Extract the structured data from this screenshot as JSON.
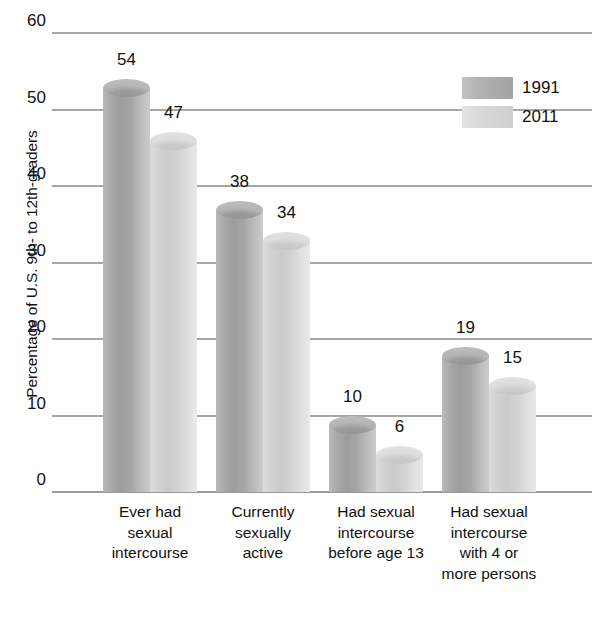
{
  "chart_data": {
    "type": "bar",
    "title": "",
    "xlabel": "",
    "ylabel": "Percentage of U.S. 9th- to 12th-graders",
    "ylim": [
      0,
      60
    ],
    "yticks": [
      0,
      10,
      20,
      30,
      40,
      50,
      60
    ],
    "grid": true,
    "legend_position": "top-right",
    "categories": [
      "Ever had sexual intercourse",
      "Currently sexually active",
      "Had sexual intercourse before age 13",
      "Had sexual intercourse with 4 or more persons"
    ],
    "category_lines": [
      [
        "Ever had",
        "sexual",
        "intercourse"
      ],
      [
        "Currently",
        "sexually",
        "active"
      ],
      [
        "Had sexual",
        "intercourse",
        "before age 13"
      ],
      [
        "Had sexual",
        "intercourse",
        "with 4 or",
        "more persons"
      ]
    ],
    "series": [
      {
        "name": "1991",
        "color": "#a8a8a8",
        "values": [
          54,
          38,
          10,
          19
        ]
      },
      {
        "name": "2011",
        "color": "#d6d6d6",
        "values": [
          47,
          34,
          6,
          15
        ]
      }
    ]
  },
  "legend": {
    "items": [
      {
        "label": "1991"
      },
      {
        "label": "2011"
      }
    ]
  },
  "axis": {
    "y_title": "Percentage of U.S. 9th- to 12th-graders",
    "tick_labels": [
      "0",
      "10",
      "20",
      "30",
      "40",
      "50",
      "60"
    ]
  }
}
